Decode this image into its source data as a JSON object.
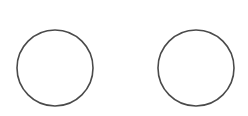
{
  "canvas": {
    "width": 248,
    "height": 116,
    "background": "#ffffff"
  },
  "shapes": [
    {
      "type": "circle",
      "name": "left-circle",
      "cx": 55,
      "cy": 68,
      "r": 38,
      "stroke": "#4a4a4a",
      "stroke_width": 1.6,
      "fill": "none"
    },
    {
      "type": "circle",
      "name": "right-circle",
      "cx": 196,
      "cy": 68,
      "r": 38,
      "stroke": "#4a4a4a",
      "stroke_width": 1.6,
      "fill": "none"
    }
  ]
}
